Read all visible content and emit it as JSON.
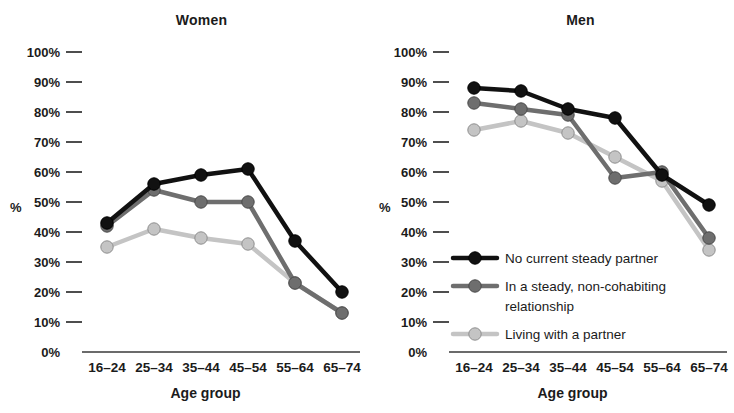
{
  "figure": {
    "y_axis_label": "%",
    "x_axis_label": "Age group"
  },
  "panels": [
    {
      "key": "women",
      "title": "Women"
    },
    {
      "key": "men",
      "title": "Men"
    }
  ],
  "legend": {
    "position": "inside-right-panel-lower-left",
    "entries": [
      {
        "label": "No current steady partner",
        "color": "#111111"
      },
      {
        "label": "In a steady, non-cohabiting relationship",
        "color": "#6e6e6e"
      },
      {
        "label": "Living with a partner",
        "color": "#c4c4c4"
      }
    ]
  },
  "axis": {
    "y_ticks": [
      "0%",
      "10%",
      "20%",
      "30%",
      "40%",
      "50%",
      "60%",
      "70%",
      "80%",
      "90%",
      "100%"
    ],
    "x_ticks": [
      "16–24",
      "25–34",
      "35–44",
      "45–54",
      "55–64",
      "65–74"
    ]
  },
  "colors": {
    "series_no_partner": "#111111",
    "series_steady_noncohab": "#6e6e6e",
    "series_living_with_partner": "#c4c4c4",
    "axis": "#3a3a3a",
    "background": "#ffffff"
  },
  "chart_data": [
    {
      "type": "line",
      "title": "Women",
      "xlabel": "Age group",
      "ylabel": "%",
      "ylim": [
        0,
        100
      ],
      "grid": false,
      "legend": "lower-left of right panel",
      "categories": [
        "16–24",
        "25–34",
        "35–44",
        "45–54",
        "55–64",
        "65–74"
      ],
      "series": [
        {
          "name": "No current steady partner",
          "color": "#111111",
          "values": [
            43,
            56,
            59,
            61,
            37,
            20
          ]
        },
        {
          "name": "In a steady, non-cohabiting relationship",
          "color": "#6e6e6e",
          "values": [
            42,
            54,
            50,
            50,
            23,
            13
          ]
        },
        {
          "name": "Living with a partner",
          "color": "#c4c4c4",
          "values": [
            35,
            41,
            38,
            36,
            23,
            13
          ]
        }
      ]
    },
    {
      "type": "line",
      "title": "Men",
      "xlabel": "Age group",
      "ylabel": "%",
      "ylim": [
        0,
        100
      ],
      "grid": false,
      "legend": "lower-left of right panel",
      "categories": [
        "16–24",
        "25–34",
        "35–44",
        "45–54",
        "55–64",
        "65–74"
      ],
      "series": [
        {
          "name": "No current steady partner",
          "color": "#111111",
          "values": [
            88,
            87,
            81,
            78,
            59,
            49
          ]
        },
        {
          "name": "In a steady, non-cohabiting relationship",
          "color": "#6e6e6e",
          "values": [
            83,
            81,
            79,
            58,
            60,
            38
          ]
        },
        {
          "name": "Living with a partner",
          "color": "#c4c4c4",
          "values": [
            74,
            77,
            73,
            65,
            57,
            34
          ]
        }
      ]
    }
  ]
}
